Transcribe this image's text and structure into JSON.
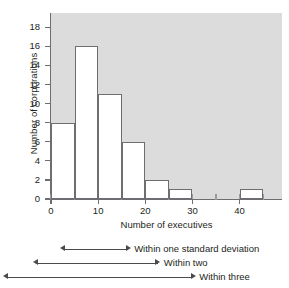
{
  "chart_data": {
    "type": "bar",
    "title": "",
    "xlabel": "Number of executives",
    "ylabel": "Number of corporations",
    "xlim": [
      0,
      49
    ],
    "ylim": [
      0,
      19.5
    ],
    "grid": false,
    "legend_position": "none",
    "bin_width": 5,
    "bin_edges": [
      0,
      5,
      10,
      15,
      20,
      25,
      30,
      35,
      40,
      45
    ],
    "categories": [
      "0-5",
      "5-10",
      "10-15",
      "15-20",
      "20-25",
      "25-30",
      "30-35",
      "35-40",
      "40-45"
    ],
    "values": [
      8,
      16,
      11,
      6,
      2,
      1,
      0,
      0,
      1
    ],
    "xticks": [
      0,
      10,
      20,
      30,
      40
    ],
    "xtick_labels": [
      "0",
      "10",
      "20",
      "30",
      "40"
    ],
    "yticks": [
      0,
      2,
      4,
      6,
      8,
      10,
      12,
      14,
      16,
      18
    ],
    "ytick_labels": [
      "0",
      "2",
      "4",
      "6",
      "8",
      "10",
      "12",
      "14",
      "16",
      "18"
    ],
    "plot_background": "#dcdcdc",
    "bar_fill": "#ffffff",
    "bar_edge": "#6d6e71",
    "annotations": [
      {
        "label": "Within one standard deviation",
        "x_start": 2,
        "x_end": 17
      },
      {
        "label": "Within two",
        "x_start": -3.8,
        "x_end": 23.3
      },
      {
        "label": "Within three",
        "x_start": -10.2,
        "x_end": 30.8
      }
    ]
  },
  "axes": {
    "ylabel": "Number of corporations",
    "xlabel": "Number of executives"
  },
  "annotations": {
    "one_sd": "Within one standard deviation",
    "two_sd": "Within two",
    "three_sd": "Within three"
  }
}
